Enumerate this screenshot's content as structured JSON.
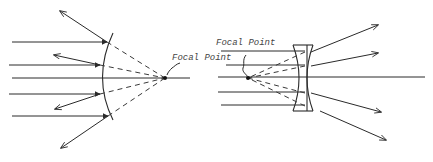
{
  "diagrams": [
    {
      "name": "convex-mirror",
      "label": "Focal Point",
      "focal_point": [
        165,
        78
      ],
      "axis": [
        12,
        78,
        190,
        78
      ],
      "incident_rays_y": [
        42,
        65,
        94,
        116
      ],
      "mirror_hits": [
        [
          107,
          42
        ],
        [
          100,
          65
        ],
        [
          100,
          94
        ],
        [
          108,
          116
        ]
      ],
      "reflected_ends": [
        [
          60,
          11
        ],
        [
          54,
          55
        ],
        [
          55,
          109
        ],
        [
          61,
          148
        ]
      ]
    },
    {
      "name": "diverging-lens",
      "label": "Focal Point",
      "focal_point": [
        248,
        78
      ],
      "axis": [
        218,
        77,
        425,
        77
      ],
      "incident_rays_y": [
        51,
        65,
        92,
        105
      ],
      "lens_hits": [
        [
          313,
          51
        ],
        [
          313,
          65
        ],
        [
          313,
          92
        ],
        [
          313,
          105
        ]
      ],
      "refracted_ends": [
        [
          378,
          25
        ],
        [
          378,
          53
        ],
        [
          381,
          112
        ],
        [
          386,
          140
        ]
      ]
    }
  ],
  "colors": {
    "line": "#2a2a2a",
    "text": "#444444",
    "background": "#ffffff"
  }
}
